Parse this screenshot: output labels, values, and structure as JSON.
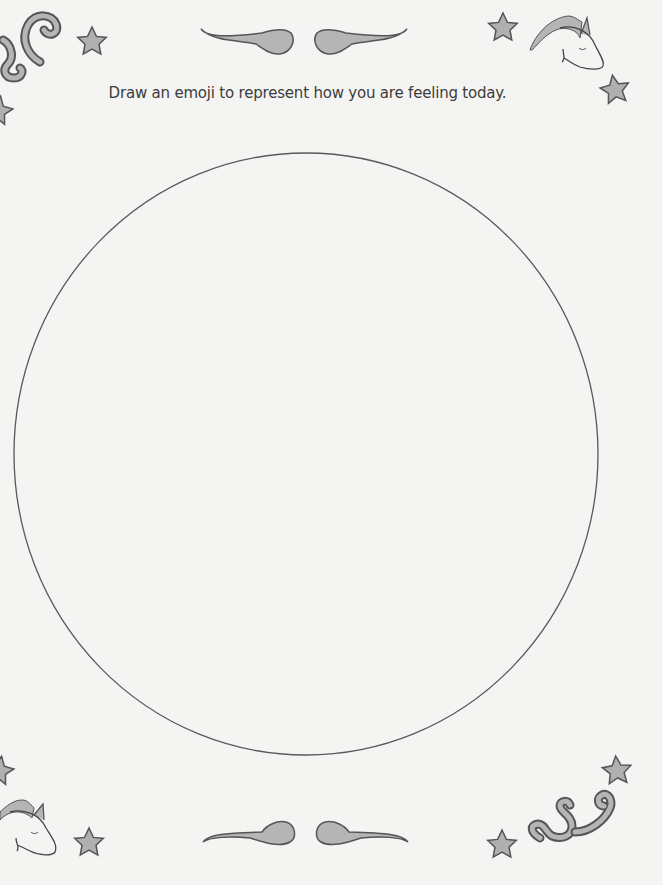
{
  "worksheet": {
    "prompt": "Draw an emoji to represent how you are feeling today.",
    "drawing_area": {
      "shape": "circle",
      "cx": 306,
      "cy": 454,
      "rx": 292,
      "ry": 301
    },
    "colors": {
      "background": "#f4f4f3",
      "outline": "#555555",
      "fill": "#b5b5b5",
      "text": "#3c3c3c"
    },
    "decorations": [
      "swirl-top-left",
      "star-top-left",
      "star-left-edge-top",
      "flourish-top-left",
      "flourish-top-right",
      "star-top-right",
      "unicorn-head-top-right",
      "star-right",
      "star-left-edge-bottom",
      "unicorn-head-bottom-left",
      "star-bottom-left",
      "flourish-bottom-left",
      "flourish-bottom-right",
      "star-bottom-right",
      "swirl-bottom-right",
      "star-far-bottom-right"
    ]
  }
}
